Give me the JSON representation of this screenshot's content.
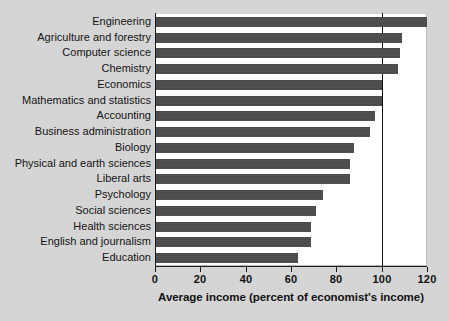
{
  "chart_data": {
    "type": "bar",
    "orientation": "horizontal",
    "title": "",
    "xlabel": "Average income (percent of economist's income)",
    "ylabel": "",
    "xlim": [
      0,
      120
    ],
    "xticks": [
      0,
      20,
      40,
      60,
      80,
      100,
      120
    ],
    "xtick_labels": [
      "0",
      "20",
      "40",
      "60",
      "80",
      "100",
      "120"
    ],
    "grid": false,
    "legend": false,
    "reference_line": {
      "value": 100,
      "label": "100",
      "color": "#111111"
    },
    "bar_color": "#4c4c4c",
    "background_color": "#d7d7d7",
    "plot_background_color": "#ffffff",
    "categories": [
      "Engineering",
      "Agriculture and forestry",
      "Computer science",
      "Chemistry",
      "Economics",
      "Mathematics and statistics",
      "Accounting",
      "Business administration",
      "Biology",
      "Physical and earth sciences",
      "Liberal arts",
      "Psychology",
      "Social sciences",
      "Health sciences",
      "English and journalism",
      "Education"
    ],
    "values": [
      120,
      109,
      108,
      107,
      100,
      100,
      97,
      95,
      88,
      86,
      86,
      74,
      71,
      69,
      69,
      63
    ]
  }
}
